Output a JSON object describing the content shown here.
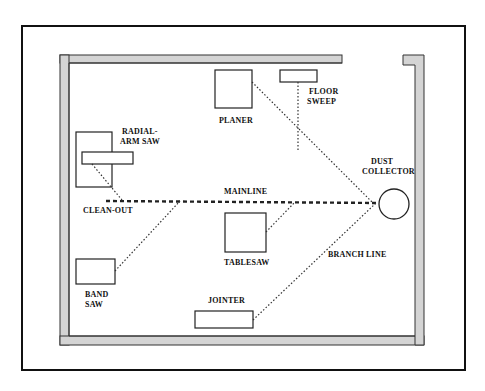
{
  "diagram": {
    "title": "",
    "labels": {
      "radial_arm_saw_1": "RADIAL-",
      "radial_arm_saw_2": "ARM SAW",
      "planer": "PLANER",
      "floor_sweep_1": "FLOOR",
      "floor_sweep_2": "SWEEP",
      "dust_collector_1": "DUST",
      "dust_collector_2": "COLLECTOR",
      "mainline": "MAINLINE",
      "clean_out": "CLEAN-OUT",
      "tablesaw": "TABLESAW",
      "branch_line": "BRANCH LINE",
      "band_saw_1": "BAND",
      "band_saw_2": "SAW",
      "jointer": "JOINTER"
    },
    "colors": {
      "wall_fill": "#d4d4d4",
      "line": "#222222",
      "background": "#ffffff"
    }
  }
}
